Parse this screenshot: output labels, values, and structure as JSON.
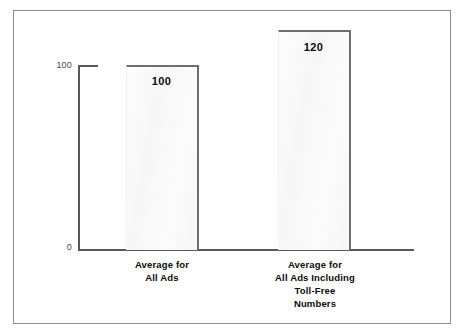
{
  "chart_data": {
    "type": "bar",
    "title": "",
    "subtitle": "",
    "xlabel": "",
    "ylabel": "",
    "categories": [
      "Average for All Ads",
      "Average for All Ads Including Toll-Free Numbers"
    ],
    "category_lines": [
      [
        "Average for",
        "All Ads"
      ],
      [
        "Average for",
        "All Ads Including",
        "Toll-Free",
        "Numbers"
      ]
    ],
    "values": [
      100,
      120
    ],
    "value_labels": [
      "100",
      "120"
    ],
    "ylim": [
      0,
      130
    ],
    "ytick_labels": [
      "100",
      "0"
    ],
    "yticks": [
      100,
      0
    ],
    "grid": false,
    "legend": false,
    "legend_position": "none",
    "bar_fill_color": "#f8f8f8",
    "bar_edge_color": "#6e6e6e",
    "axis_color": "#595959",
    "frame_color": "#8d8d8d",
    "background_color": "#ffffff"
  },
  "axis": {
    "y_label_top": "100",
    "y_label_bottom": "0"
  },
  "bars": [
    {
      "value_label": "100"
    },
    {
      "value_label": "120"
    }
  ],
  "categories": [
    {
      "line1": "Average for",
      "line2": "All Ads",
      "line3": "",
      "line4": ""
    },
    {
      "line1": "Average for",
      "line2": "All Ads Including",
      "line3": "Toll-Free",
      "line4": "Numbers"
    }
  ]
}
